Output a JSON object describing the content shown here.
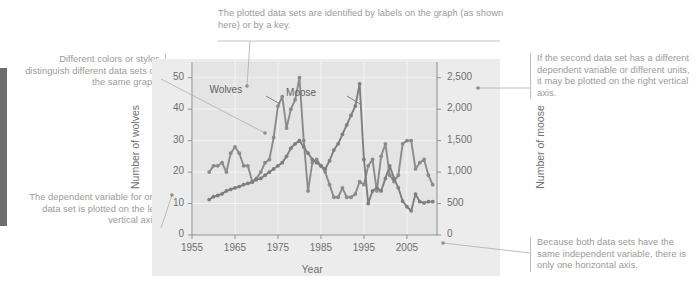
{
  "annotations": {
    "top": "The plotted data sets are identified by labels on the graph (as shown here) or by a key.",
    "left_top": "Different colors or styles distinguish different data sets on the same graph.",
    "left_bottom": "The dependent variable for one data set is plotted on the left vertical axis.",
    "right_top": "If the second data set has a different dependent variable or different units, it may be plotted on the right vertical axis.",
    "right_bottom": "Because both data sets have the same independent variable, there is only one horizontal axis."
  },
  "chart_data": {
    "type": "line",
    "title": "",
    "xlabel": "Year",
    "ylabel": "Number of wolves",
    "y2label": "Number of moose",
    "xlim": [
      1955,
      2012
    ],
    "ylim": [
      0,
      55
    ],
    "y2lim": [
      0,
      2750
    ],
    "xticks": [
      "1955",
      "1965",
      "1975",
      "1985",
      "1995",
      "2005"
    ],
    "xtick_values": [
      1955,
      1965,
      1975,
      1985,
      1995,
      2005
    ],
    "yticks": [
      "0",
      "10",
      "20",
      "30",
      "40",
      "50"
    ],
    "ytick_values": [
      0,
      10,
      20,
      30,
      40,
      50
    ],
    "y2ticks": [
      "0",
      "500",
      "1,000",
      "1,500",
      "2,000",
      "2,500"
    ],
    "y2tick_values": [
      0,
      500,
      1000,
      1500,
      2000,
      2500
    ],
    "grid": true,
    "legend_position": "inline-labels",
    "colors": {
      "wolves": "#8b8b8b",
      "moose": "#7e7e7e",
      "panel": "#e4e4e4",
      "figure": "#ececec",
      "axis": "#8f8f8f",
      "grid": "#f4f4f4",
      "annotation_text": "#9a9a9a",
      "annotation_rule": "#bdbdbd",
      "spine": "#6e6e6e"
    },
    "series": [
      {
        "name": "Wolves",
        "axis": "left",
        "label_x": 1967,
        "label_y": 46,
        "x": [
          1959,
          1960,
          1961,
          1962,
          1963,
          1964,
          1965,
          1966,
          1967,
          1968,
          1969,
          1970,
          1971,
          1972,
          1973,
          1974,
          1975,
          1976,
          1977,
          1978,
          1979,
          1980,
          1981,
          1982,
          1983,
          1984,
          1985,
          1986,
          1987,
          1988,
          1989,
          1990,
          1991,
          1992,
          1993,
          1994,
          1995,
          1996,
          1997,
          1998,
          1999,
          2000,
          2001,
          2002,
          2003,
          2004,
          2005,
          2006,
          2007,
          2008,
          2009,
          2010,
          2011
        ],
        "values": [
          20,
          22,
          22,
          23,
          20,
          26,
          28,
          26,
          22,
          22,
          17,
          18,
          20,
          23,
          24,
          31,
          41,
          44,
          34,
          40,
          43,
          50,
          30,
          14,
          23,
          24,
          22,
          20,
          16,
          12,
          12,
          15,
          12,
          12,
          13,
          17,
          16,
          22,
          24,
          14,
          25,
          29,
          19,
          17,
          19,
          29,
          30,
          30,
          21,
          23,
          24,
          19,
          16
        ]
      },
      {
        "name": "Moose",
        "axis": "right",
        "label_x": 1982,
        "label_y": 2250,
        "x": [
          1959,
          1960,
          1961,
          1962,
          1963,
          1964,
          1965,
          1966,
          1967,
          1968,
          1969,
          1970,
          1971,
          1972,
          1973,
          1974,
          1975,
          1976,
          1977,
          1978,
          1979,
          1980,
          1981,
          1982,
          1983,
          1984,
          1985,
          1986,
          1987,
          1988,
          1989,
          1990,
          1991,
          1992,
          1993,
          1994,
          1995,
          1996,
          1997,
          1998,
          1999,
          2000,
          2001,
          2002,
          2003,
          2004,
          2005,
          2006,
          2007,
          2008,
          2009,
          2010,
          2011
        ],
        "values": [
          563,
          610,
          628,
          654,
          700,
          725,
          750,
          770,
          800,
          820,
          840,
          880,
          900,
          950,
          1000,
          1050,
          1100,
          1150,
          1250,
          1380,
          1450,
          1500,
          1400,
          1300,
          1200,
          1150,
          1100,
          1050,
          1180,
          1350,
          1450,
          1600,
          1750,
          1900,
          2050,
          2400,
          1200,
          500,
          700,
          750,
          700,
          900,
          1100,
          900,
          750,
          540,
          450,
          385,
          650,
          530,
          510,
          530,
          530
        ]
      }
    ]
  }
}
